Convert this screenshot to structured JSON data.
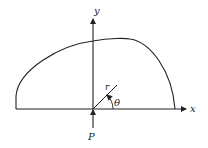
{
  "diagram": {
    "type": "polar-coordinate force diagram",
    "labels": {
      "y_axis": "y",
      "x_axis": "x",
      "radius": "r",
      "angle": "θ",
      "force": "P"
    },
    "colors": {
      "stroke": "#222222",
      "background": "#ffffff"
    }
  }
}
